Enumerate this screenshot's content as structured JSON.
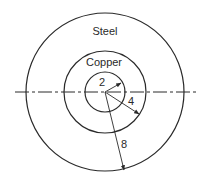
{
  "diagram": {
    "type": "concentric-circles-cross-section",
    "center": {
      "x": 105,
      "y": 92
    },
    "regions": [
      {
        "name": "Steel",
        "label": "Steel"
      },
      {
        "name": "Copper",
        "label": "Copper"
      }
    ],
    "labels": {
      "steel": "Steel",
      "copper": "Copper"
    },
    "dimensions": {
      "inner_radius": "2",
      "middle_radius": "4",
      "outer_radius": "8"
    },
    "colors": {
      "stroke": "#2a2a2a",
      "background": "#ffffff"
    }
  }
}
